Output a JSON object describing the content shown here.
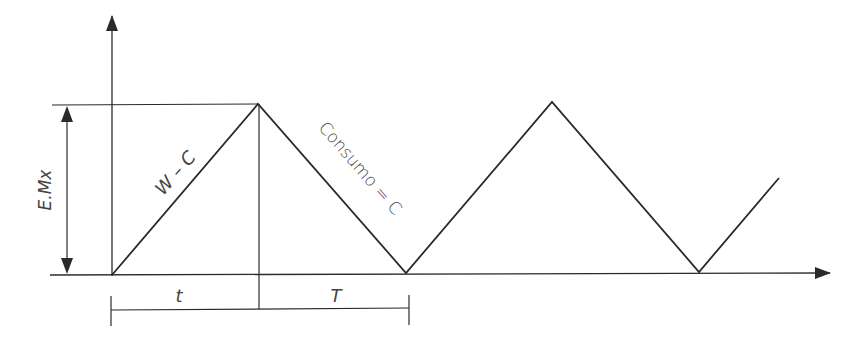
{
  "diagram": {
    "type": "inventory-sawtooth",
    "labels": {
      "max_stock": "E.Mx",
      "rise_slope": "W – C",
      "fall_slope": "Consumo = C",
      "t": "t",
      "T": "T"
    },
    "colors": {
      "line": "#2a2a2a",
      "text": "#444444",
      "background": "#ffffff"
    },
    "waveform_points": [
      [
        112,
        275
      ],
      [
        258,
        104
      ],
      [
        406,
        273
      ],
      [
        552,
        102
      ],
      [
        699,
        272
      ],
      [
        779,
        178
      ]
    ]
  }
}
